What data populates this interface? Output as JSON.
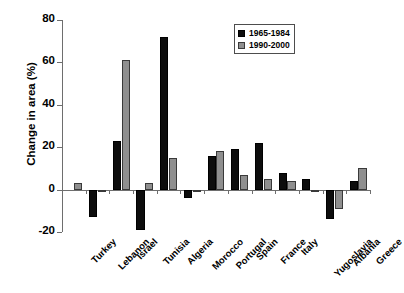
{
  "chart_data": {
    "type": "bar",
    "title": "",
    "xlabel": "",
    "ylabel": "Change in area (%)",
    "ylim": [
      -20,
      80
    ],
    "yticks": [
      -20,
      0,
      20,
      40,
      60,
      80
    ],
    "ytick_labels": [
      "-20",
      "0",
      "20",
      "40",
      "60",
      "80"
    ],
    "grid": false,
    "legend_position": "top-right",
    "categories": [
      "Turkey",
      "Lebanon",
      "Israel",
      "Tunisia",
      "Algeria",
      "Morocco",
      "Portugal",
      "Spain",
      "France",
      "Italy",
      "Yugoslavia",
      "Albania",
      "Greece"
    ],
    "series": [
      {
        "name": "1965-1984",
        "color": "#0d0d0d",
        "values": [
          0,
          -13,
          23,
          -19,
          72,
          -4,
          16,
          19,
          22,
          8,
          5,
          -14,
          4
        ]
      },
      {
        "name": "1990-2000",
        "color": "#8f8f8f",
        "values": [
          3,
          -1,
          61,
          3,
          15,
          -1,
          18,
          7,
          5,
          4,
          -0.5,
          -9,
          10
        ]
      }
    ]
  }
}
